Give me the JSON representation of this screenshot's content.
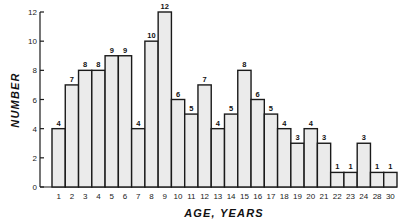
{
  "chart_data": {
    "type": "bar",
    "title": "",
    "xlabel": "AGE, YEARS",
    "ylabel": "NUMBER",
    "ylim": [
      0,
      12
    ],
    "yticks": [
      0,
      2,
      4,
      6,
      8,
      10,
      12
    ],
    "grid": false,
    "legend": null,
    "categories": [
      "1",
      "2",
      "3",
      "4",
      "5",
      "6",
      "7",
      "8",
      "9",
      "10",
      "11",
      "12",
      "13",
      "14",
      "15",
      "16",
      "17",
      "18",
      "19",
      "20",
      "21",
      "22",
      "23",
      "24",
      "28",
      "30"
    ],
    "values": [
      4,
      7,
      8,
      8,
      9,
      9,
      4,
      10,
      12,
      6,
      5,
      7,
      4,
      5,
      8,
      6,
      5,
      4,
      3,
      4,
      3,
      1,
      1,
      3,
      1,
      1
    ],
    "data_labels": true
  },
  "colors": {
    "bar_fill": "#ebebeb",
    "bar_stroke": "#1a1a1a",
    "background": "#ffffff"
  }
}
